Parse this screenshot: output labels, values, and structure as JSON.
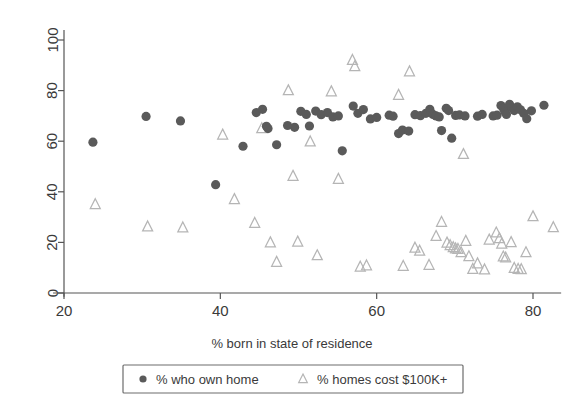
{
  "chart_data": {
    "type": "scatter",
    "title": "",
    "xlabel": "% born in state of residence",
    "ylabel": "",
    "xlim": [
      18.5,
      83.5
    ],
    "ylim": [
      -2,
      104
    ],
    "xticks": [
      20,
      40,
      60,
      80
    ],
    "yticks": [
      0,
      20,
      40,
      60,
      80,
      100
    ],
    "grid": false,
    "legend_position": "bottom",
    "series": [
      {
        "name": "% who own home",
        "marker": "filled-circle",
        "color": "#5a5a5a",
        "points": [
          [
            23.7,
            59.6
          ],
          [
            30.5,
            69.8
          ],
          [
            34.9,
            68.0
          ],
          [
            39.4,
            42.8
          ],
          [
            42.9,
            58.0
          ],
          [
            44.6,
            71.3
          ],
          [
            45.4,
            72.6
          ],
          [
            45.9,
            65.9
          ],
          [
            46.1,
            65.0
          ],
          [
            47.2,
            58.6
          ],
          [
            48.6,
            66.2
          ],
          [
            49.5,
            65.5
          ],
          [
            50.3,
            71.8
          ],
          [
            51.0,
            70.6
          ],
          [
            51.4,
            66.0
          ],
          [
            52.2,
            71.9
          ],
          [
            52.9,
            70.5
          ],
          [
            53.7,
            71.3
          ],
          [
            54.4,
            69.6
          ],
          [
            55.1,
            70.0
          ],
          [
            55.6,
            56.2
          ],
          [
            57.0,
            73.9
          ],
          [
            57.6,
            71.0
          ],
          [
            58.3,
            72.5
          ],
          [
            59.2,
            68.8
          ],
          [
            60.0,
            69.4
          ],
          [
            61.6,
            70.3
          ],
          [
            62.1,
            69.9
          ],
          [
            62.8,
            63.0
          ],
          [
            63.3,
            64.4
          ],
          [
            64.1,
            64.0
          ],
          [
            64.9,
            70.5
          ],
          [
            65.6,
            70.1
          ],
          [
            66.3,
            71.0
          ],
          [
            66.8,
            72.6
          ],
          [
            67.2,
            70.6
          ],
          [
            67.6,
            70.0
          ],
          [
            68.0,
            69.6
          ],
          [
            68.3,
            64.2
          ],
          [
            68.9,
            73.0
          ],
          [
            69.2,
            72.1
          ],
          [
            69.6,
            61.2
          ],
          [
            70.1,
            70.2
          ],
          [
            70.6,
            70.4
          ],
          [
            71.3,
            70.0
          ],
          [
            72.9,
            69.9
          ],
          [
            73.5,
            70.6
          ],
          [
            74.9,
            70.0
          ],
          [
            75.4,
            70.3
          ],
          [
            75.9,
            74.1
          ],
          [
            76.2,
            73.0
          ],
          [
            76.4,
            71.6
          ],
          [
            76.6,
            70.6
          ],
          [
            77.0,
            74.6
          ],
          [
            77.3,
            73.2
          ],
          [
            77.6,
            72.1
          ],
          [
            78.0,
            73.6
          ],
          [
            78.4,
            72.4
          ],
          [
            78.8,
            71.0
          ],
          [
            79.2,
            68.9
          ],
          [
            79.8,
            72.0
          ],
          [
            81.4,
            74.2
          ]
        ]
      },
      {
        "name": "% homes cost $100K+",
        "marker": "open-triangle",
        "color": "#b5b5b5",
        "points": [
          [
            24.0,
            35.0
          ],
          [
            30.7,
            26.2
          ],
          [
            35.2,
            25.8
          ],
          [
            40.3,
            62.5
          ],
          [
            41.8,
            37.0
          ],
          [
            44.4,
            27.6
          ],
          [
            45.3,
            65.0
          ],
          [
            46.4,
            19.9
          ],
          [
            47.2,
            12.2
          ],
          [
            48.7,
            80.0
          ],
          [
            49.3,
            46.2
          ],
          [
            49.9,
            20.2
          ],
          [
            51.5,
            59.8
          ],
          [
            52.4,
            14.8
          ],
          [
            54.2,
            79.6
          ],
          [
            55.1,
            45.0
          ],
          [
            56.9,
            92.0
          ],
          [
            57.2,
            89.5
          ],
          [
            57.9,
            10.3
          ],
          [
            58.7,
            10.8
          ],
          [
            62.8,
            78.2
          ],
          [
            63.4,
            10.6
          ],
          [
            64.2,
            87.5
          ],
          [
            64.9,
            17.8
          ],
          [
            65.5,
            16.6
          ],
          [
            66.7,
            11.0
          ],
          [
            67.6,
            22.4
          ],
          [
            68.3,
            28.0
          ],
          [
            69.0,
            19.8
          ],
          [
            69.4,
            18.8
          ],
          [
            69.8,
            18.0
          ],
          [
            70.1,
            17.5
          ],
          [
            70.4,
            17.3
          ],
          [
            70.8,
            16.0
          ],
          [
            71.1,
            54.8
          ],
          [
            71.4,
            20.5
          ],
          [
            71.8,
            14.4
          ],
          [
            72.3,
            9.4
          ],
          [
            72.9,
            11.6
          ],
          [
            73.8,
            9.2
          ],
          [
            74.4,
            21.0
          ],
          [
            75.3,
            23.8
          ],
          [
            75.7,
            21.5
          ],
          [
            76.0,
            19.4
          ],
          [
            76.2,
            14.3
          ],
          [
            76.5,
            13.9
          ],
          [
            77.2,
            20.0
          ],
          [
            77.6,
            9.8
          ],
          [
            78.1,
            9.4
          ],
          [
            78.5,
            9.3
          ],
          [
            79.1,
            16.0
          ],
          [
            80.0,
            30.2
          ],
          [
            82.6,
            25.9
          ]
        ]
      }
    ]
  },
  "legend": {
    "items": [
      {
        "label": "% who own home",
        "marker": "filled-circle"
      },
      {
        "label": "% homes cost $100K+",
        "marker": "open-triangle"
      }
    ]
  },
  "colors": {
    "circle": "#5a5a5a",
    "triangle": "#b5b5b5",
    "axis": "#555555",
    "text": "#3a3a3a",
    "background": "#ffffff"
  }
}
